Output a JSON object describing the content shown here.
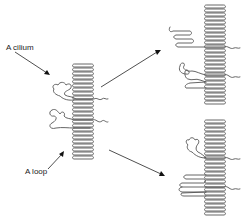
{
  "figure": {
    "labels": {
      "cilium": "A cilium",
      "loop": "A loop"
    },
    "colors": {
      "line": "#555555",
      "arrow": "#222222",
      "background": "#ffffff"
    },
    "panels": [
      {
        "id": "initial-state",
        "description": "Polymer brush/helix column with one cilium and one loop attached"
      },
      {
        "id": "outcome-top",
        "description": "Column with a folded cilium and a coiled loop"
      },
      {
        "id": "outcome-bottom",
        "description": "Column with a coiled cilium and a folded loop"
      }
    ]
  }
}
